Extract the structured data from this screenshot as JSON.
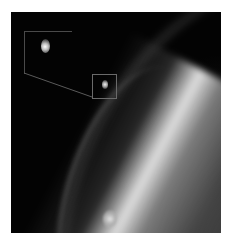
{
  "image": {
    "description": "Grayscale astronomical image of a bright planetary limb with faint arcs and small moons",
    "background_color": "#030303",
    "frame": {
      "left": 11,
      "top": 12,
      "width": 210,
      "height": 221
    }
  },
  "annotations": {
    "inset_box": {
      "label": "",
      "left": 24,
      "top": 31,
      "width": 47,
      "height": 42
    },
    "source_box": {
      "label": "",
      "left": 92,
      "top": 74,
      "width": 23,
      "height": 23
    },
    "line_color": "#6a6a6a"
  },
  "features": [
    {
      "name": "bright-limb",
      "color": "#e8e8e8"
    },
    {
      "name": "faint-arc",
      "color": "#707070"
    },
    {
      "name": "moon-magnified",
      "color": "#ffffff"
    },
    {
      "name": "moon-small",
      "color": "#f0f0f0"
    },
    {
      "name": "moon-lower",
      "color": "#e6e6e6"
    }
  ]
}
